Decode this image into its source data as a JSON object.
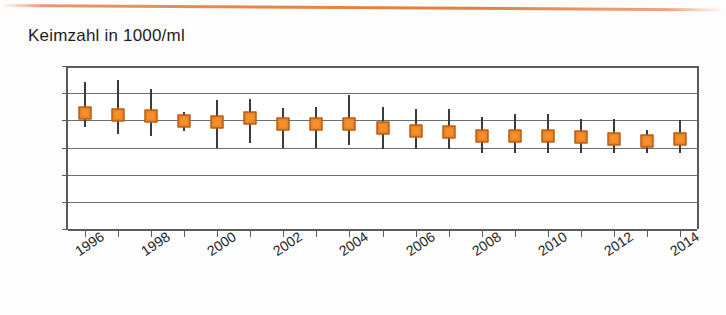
{
  "chart_data": {
    "type": "scatter",
    "title": "Keimzahl in 1000/ml",
    "xlabel": "",
    "ylabel": "Keimzahl in 1000/ml",
    "ylim": [
      0,
      30
    ],
    "yticks": [
      0,
      5,
      10,
      15,
      20,
      25,
      30
    ],
    "grid": true,
    "legend": "none",
    "marker_color": "#ef8020",
    "marker_edge_color": "#9a4f12",
    "whisker_color": "#3b3b3b",
    "axis_color": "#5a5a5a",
    "gridline_color": "#6e6e6e",
    "series_name": "Keimzahl",
    "categories": [
      1996,
      1997,
      1998,
      1999,
      2000,
      2001,
      2002,
      2003,
      2004,
      2005,
      2006,
      2007,
      2008,
      2009,
      2010,
      2011,
      2012,
      2013,
      2014
    ],
    "xtick_labels": [
      "1996",
      "1998",
      "2000",
      "2002",
      "2004",
      "2006",
      "2008",
      "2010",
      "2012",
      "2014"
    ],
    "xtick_label_years": [
      1996,
      1998,
      2000,
      2002,
      2004,
      2006,
      2008,
      2010,
      2012,
      2014
    ],
    "values": [
      21.3,
      21.0,
      20.8,
      19.8,
      19.7,
      20.4,
      19.3,
      19.3,
      19.4,
      18.6,
      18.0,
      17.8,
      17.2,
      17.2,
      17.2,
      16.9,
      16.5,
      16.2,
      16.6
    ],
    "error_low": [
      18.8,
      17.5,
      17.2,
      18.1,
      14.9,
      15.9,
      14.9,
      14.9,
      15.5,
      14.7,
      14.7,
      14.8,
      13.9,
      13.9,
      13.9,
      13.9,
      13.9,
      14.0,
      13.9
    ],
    "error_high": [
      27.0,
      27.4,
      25.8,
      21.6,
      23.7,
      24.0,
      22.3,
      22.4,
      24.6,
      22.4,
      22.0,
      22.0,
      20.7,
      21.2,
      21.2,
      20.3,
      20.3,
      18.3,
      20.1
    ]
  }
}
